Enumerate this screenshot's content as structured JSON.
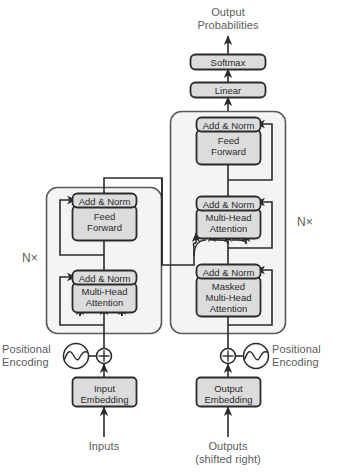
{
  "figure": {
    "colors": {
      "box_fill": "#dcdcdc",
      "box_stroke": "#2b2b2b",
      "container_fill": "#f4f4f4",
      "container_stroke": "#595959",
      "line": "#2b2b2b",
      "text_label": "#5b5b5b",
      "text_box": "#2b2b2b",
      "background": "#ffffff"
    }
  },
  "labels": {
    "output_probabilities_line1": "Output",
    "output_probabilities_line2": "Probabilities",
    "inputs": "Inputs",
    "outputs_line1": "Outputs",
    "outputs_line2": "(shifted right)",
    "positional_encoding_left_line1": "Positional",
    "positional_encoding_left_line2": "Encoding",
    "positional_encoding_right_line1": "Positional",
    "positional_encoding_right_line2": "Encoding",
    "encoder_repeat": "N×",
    "decoder_repeat": "N×"
  },
  "boxes": {
    "softmax": "Softmax",
    "linear": "Linear",
    "encoder_add_norm_top": "Add & Norm",
    "encoder_feed_forward_line1": "Feed",
    "encoder_feed_forward_line2": "Forward",
    "encoder_add_norm_bottom": "Add & Norm",
    "encoder_attention_line1": "Multi-Head",
    "encoder_attention_line2": "Attention",
    "decoder_add_norm_top": "Add & Norm",
    "decoder_feed_forward_line1": "Feed",
    "decoder_feed_forward_line2": "Forward",
    "decoder_add_norm_mid": "Add & Norm",
    "decoder_attention_line1": "Multi-Head",
    "decoder_attention_line2": "Attention",
    "decoder_add_norm_bottom": "Add & Norm",
    "decoder_masked_attention_line1": "Masked",
    "decoder_masked_attention_line2": "Multi-Head",
    "decoder_masked_attention_line3": "Attention",
    "input_embedding_line1": "Input",
    "input_embedding_line2": "Embedding",
    "output_embedding_line1": "Output",
    "output_embedding_line2": "Embedding"
  },
  "icons": {
    "add_operator_left": "⊕",
    "add_operator_right": "⊕",
    "sine_wave_left": "sine-wave-icon",
    "sine_wave_right": "sine-wave-icon"
  }
}
